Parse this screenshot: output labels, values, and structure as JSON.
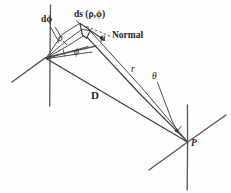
{
  "figure": {
    "background_color": "#fefefe",
    "ink_color": "#3a3a3e",
    "width": 231,
    "height": 193
  },
  "labels": {
    "d_phi": "dϕ",
    "ds_element": "ds (ρ,ϕ)",
    "rho": "ρ",
    "phi": "ϕ",
    "normal": "Normal",
    "theta_normal": "θ",
    "r": "r",
    "theta_p": "θ",
    "D": "D",
    "point_p": "P"
  },
  "geometry": {
    "source_origin": {
      "x": 46,
      "y": 58
    },
    "field_point": {
      "x": 188,
      "y": 142
    },
    "ds_patch_center": {
      "x": 86,
      "y": 30
    },
    "source_vertical_axis": {
      "x1": 50,
      "y1": 5,
      "x2": 50,
      "y2": 106
    },
    "source_diagonal_axis": {
      "x1": 12,
      "y1": 82,
      "x2": 96,
      "y2": 46
    },
    "p_vertical_axis": {
      "x1": 187,
      "y1": 105,
      "x2": 187,
      "y2": 190
    },
    "p_diagonal_axis": {
      "x1": 149,
      "y1": 170,
      "x2": 226,
      "y2": 115
    }
  },
  "quantities": {
    "r_description": "distance from surface element to point P",
    "D_description": "distance from source origin to point P",
    "theta_description": "angle between normal and direction to P",
    "phi_description": "azimuthal angle on source plane",
    "rho_description": "radial coordinate of element on source plane",
    "d_phi_description": "differential azimuthal angle"
  }
}
